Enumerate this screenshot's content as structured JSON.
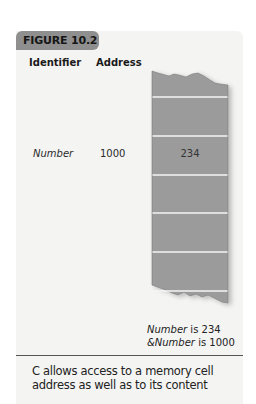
{
  "figure": {
    "label": "FIGURE 10.2",
    "headers": {
      "identifier": "Identifier",
      "address": "Address"
    },
    "row": {
      "identifier": "Number",
      "address": "1000",
      "value": "234"
    },
    "memory_column": {
      "cell_count": 7,
      "fill_color": "#9b9b9b",
      "line_color": "#f2f2f2"
    },
    "annotations": [
      {
        "italic": "Number",
        "rest": " is 234"
      },
      {
        "italic": "&Number",
        "rest": " is 1000"
      }
    ],
    "caption": "C allows access to a memory cell address as well as to its content"
  }
}
